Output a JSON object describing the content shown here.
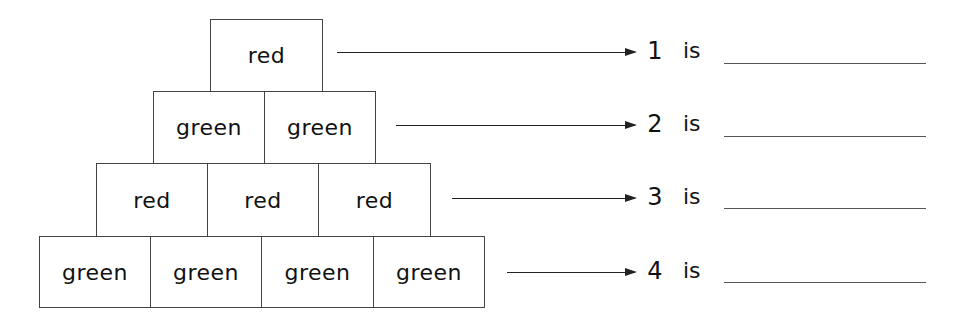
{
  "worksheet": {
    "pyramid": {
      "rows": [
        {
          "row": 1,
          "cells": [
            "red"
          ]
        },
        {
          "row": 2,
          "cells": [
            "green",
            "green"
          ]
        },
        {
          "row": 3,
          "cells": [
            "red",
            "red",
            "red"
          ]
        },
        {
          "row": 4,
          "cells": [
            "green",
            "green",
            "green",
            "green"
          ]
        }
      ]
    },
    "questions": [
      {
        "number": "1",
        "text": "is",
        "answer": ""
      },
      {
        "number": "2",
        "text": "is",
        "answer": ""
      },
      {
        "number": "3",
        "text": "is",
        "answer": ""
      },
      {
        "number": "4",
        "text": "is",
        "answer": ""
      }
    ]
  }
}
